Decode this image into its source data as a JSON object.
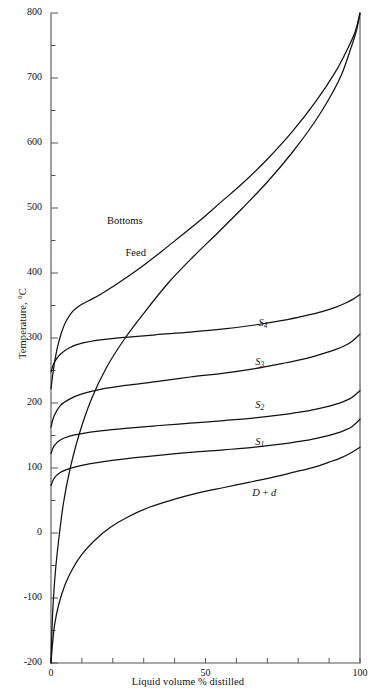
{
  "chart_data": {
    "type": "line",
    "title": "",
    "xlabel": "Liquid volume % distilled",
    "ylabel": "Temperature, °C",
    "xlim": [
      0,
      100
    ],
    "ylim": [
      -200,
      800
    ],
    "grid": false,
    "legend_position": "inline-labels",
    "x_ticks": [
      0,
      50,
      100
    ],
    "x_tick_labels": [
      "0",
      "50",
      "100"
    ],
    "x_minor_step": 10,
    "y_ticks": [
      -200,
      -100,
      0,
      100,
      200,
      300,
      400,
      500,
      600,
      700,
      800
    ],
    "y_tick_labels": [
      "-200",
      "-100",
      "0",
      "100",
      "200",
      "300",
      "400",
      "500",
      "600",
      "700",
      "800"
    ],
    "y_minor_step": 50,
    "line_color": "#111111",
    "axis_color": "#555555",
    "background": "#ffffff",
    "series": [
      {
        "name": "Bottoms",
        "label": "Bottoms",
        "label_x": 22,
        "label_y": 478,
        "x": [
          0,
          0.4,
          1,
          2,
          3.5,
          5,
          7,
          9,
          12,
          16,
          20,
          25,
          30,
          36,
          42,
          48,
          55,
          62,
          70,
          78,
          86,
          92,
          96,
          98.5,
          100
        ],
        "y": [
          222,
          238,
          258,
          284,
          310,
          327,
          341,
          349,
          357,
          367,
          379,
          395,
          412,
          434,
          457,
          480,
          509,
          538,
          575,
          617,
          666,
          709,
          745,
          772,
          800
        ]
      },
      {
        "name": "Feed",
        "label": "Feed",
        "label_x": 28,
        "label_y": 430,
        "x": [
          0,
          0.3,
          0.8,
          1.5,
          2.5,
          4,
          6,
          9,
          13,
          18,
          24,
          30,
          38,
          46,
          54,
          62,
          70,
          78,
          85,
          90,
          94,
          97,
          98.8,
          100
        ],
        "y": [
          -200,
          -150,
          -100,
          -55,
          -10,
          45,
          95,
          150,
          205,
          255,
          300,
          338,
          385,
          425,
          462,
          500,
          540,
          585,
          630,
          668,
          705,
          745,
          772,
          800
        ]
      },
      {
        "name": "S4",
        "label": "S₄",
        "label_x": 71,
        "label_y": 322,
        "x": [
          0,
          1,
          3,
          6,
          10,
          16,
          24,
          34,
          45,
          56,
          66,
          75,
          82,
          88,
          92,
          95,
          97.5,
          100
        ],
        "y": [
          248,
          262,
          275,
          285,
          292,
          297,
          301,
          305,
          309,
          314,
          320,
          327,
          334,
          341,
          347,
          353,
          359,
          367
        ]
      },
      {
        "name": "S3",
        "label": "S₃",
        "label_x": 70,
        "label_y": 262,
        "x": [
          0,
          1,
          3,
          6,
          10,
          16,
          24,
          34,
          45,
          56,
          66,
          75,
          82,
          88,
          92,
          95,
          97.5,
          100
        ],
        "y": [
          163,
          180,
          196,
          206,
          214,
          221,
          227,
          233,
          240,
          246,
          253,
          261,
          268,
          276,
          282,
          288,
          295,
          306
        ]
      },
      {
        "name": "S2",
        "label": "S₂",
        "label_x": 70,
        "label_y": 195,
        "x": [
          0,
          1,
          3,
          6,
          10,
          16,
          24,
          34,
          45,
          56,
          66,
          75,
          82,
          88,
          92,
          95,
          97.5,
          100
        ],
        "y": [
          122,
          134,
          143,
          149,
          153,
          157,
          161,
          165,
          169,
          173,
          177,
          182,
          187,
          193,
          198,
          203,
          209,
          219
        ]
      },
      {
        "name": "S1",
        "label": "S₁",
        "label_x": 70,
        "label_y": 138,
        "x": [
          0,
          1,
          3,
          6,
          10,
          16,
          24,
          34,
          45,
          56,
          66,
          75,
          82,
          88,
          92,
          95,
          97.5,
          100
        ],
        "y": [
          73,
          84,
          93,
          99,
          104,
          109,
          114,
          119,
          124,
          128,
          132,
          137,
          142,
          148,
          153,
          158,
          164,
          175
        ]
      },
      {
        "name": "D+d",
        "label": "D + d",
        "label_x": 69,
        "label_y": 60,
        "x": [
          0,
          0.5,
          1.2,
          2.5,
          4.5,
          7,
          10,
          14,
          19,
          25,
          32,
          40,
          48,
          56,
          64,
          72,
          79,
          85,
          90,
          94,
          97,
          100
        ],
        "y": [
          -200,
          -170,
          -140,
          -110,
          -80,
          -55,
          -33,
          -12,
          8,
          25,
          40,
          52,
          62,
          70,
          78,
          86,
          94,
          101,
          109,
          116,
          123,
          132
        ]
      }
    ]
  }
}
